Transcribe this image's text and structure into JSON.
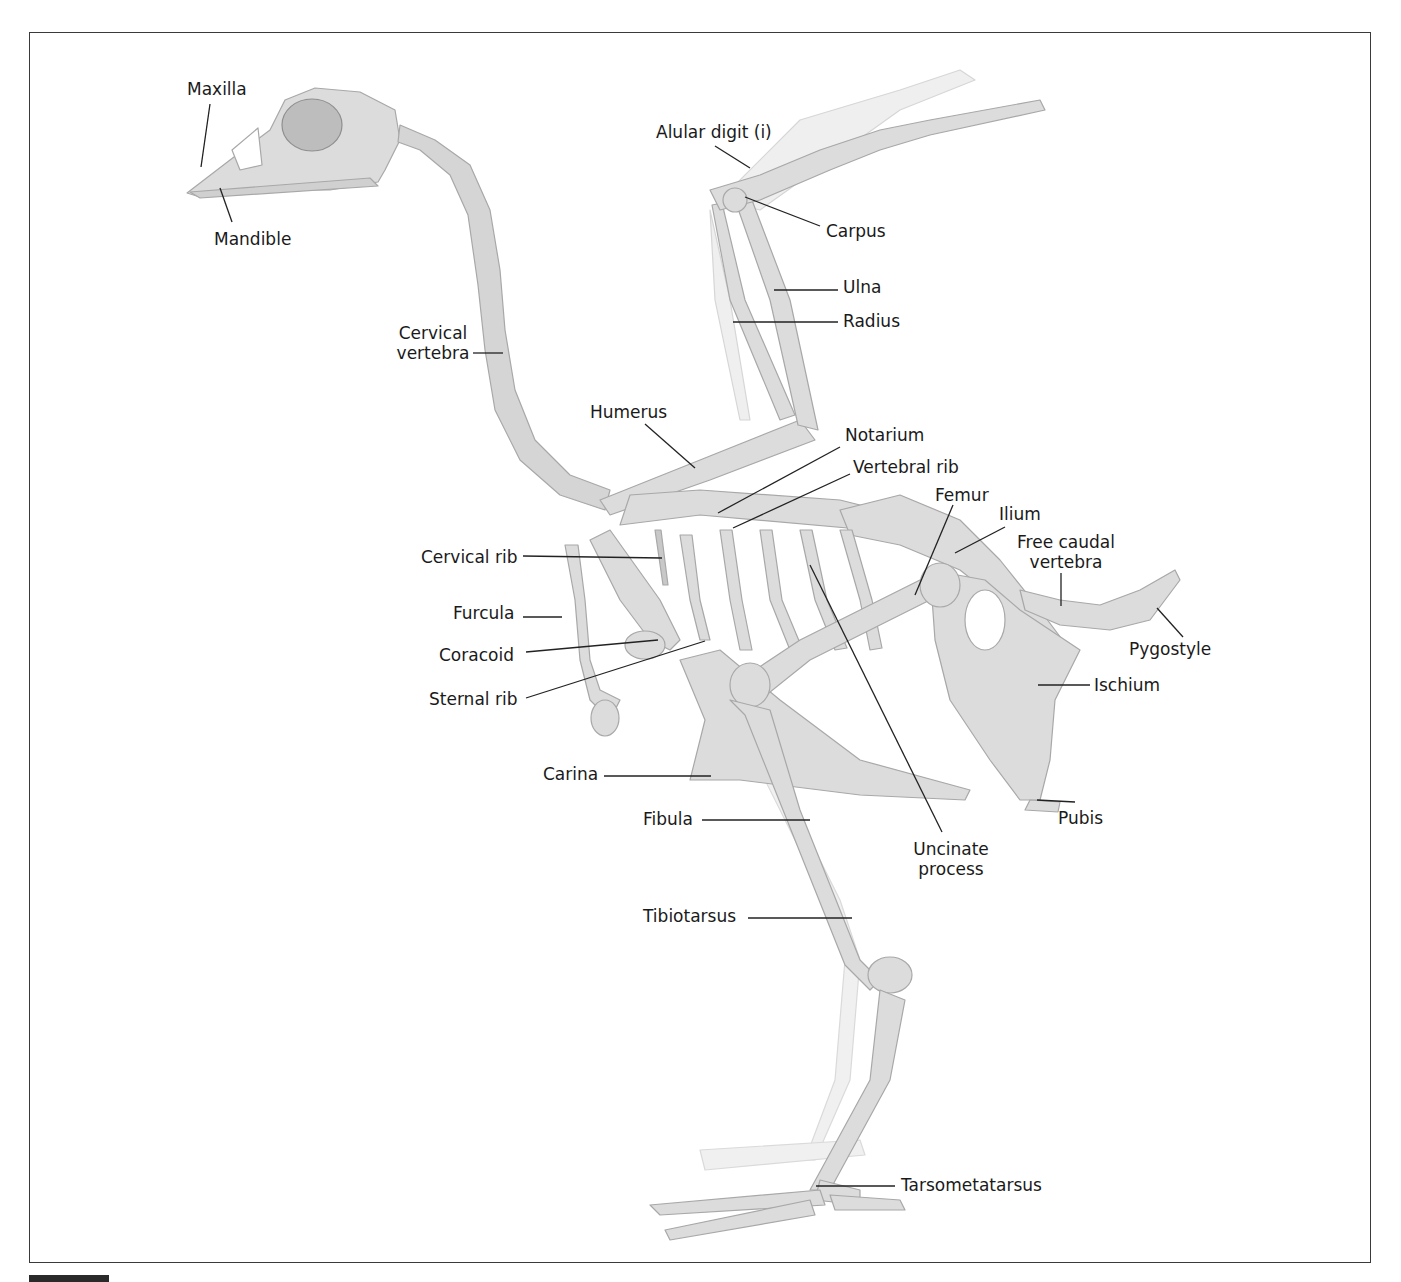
{
  "figure": {
    "colors": {
      "bone": "#d9d9d9",
      "bone_outline": "#a8a8a8",
      "bone_dark": "#b9b9b9",
      "ghost": "#ededed",
      "leader": "#222222",
      "frame": "#3a3a3a"
    }
  },
  "labels": {
    "maxilla": "Maxilla",
    "mandible": "Mandible",
    "alular_digit": "Alular digit (i)",
    "carpus": "Carpus",
    "ulna": "Ulna",
    "radius": "Radius",
    "cervical_vertebra_1": "Cervical",
    "cervical_vertebra_2": "vertebra",
    "humerus": "Humerus",
    "notarium": "Notarium",
    "vertebral_rib": "Vertebral rib",
    "femur": "Femur",
    "ilium": "Ilium",
    "free_caudal_1": "Free caudal",
    "free_caudal_2": "vertebra",
    "pygostyle": "Pygostyle",
    "cervical_rib": "Cervical rib",
    "furcula": "Furcula",
    "coracoid": "Coracoid",
    "sternal_rib": "Sternal rib",
    "ischium": "Ischium",
    "carina": "Carina",
    "pubis": "Pubis",
    "fibula": "Fibula",
    "uncinate_1": "Uncinate",
    "uncinate_2": "process",
    "tibiotarsus": "Tibiotarsus",
    "tarsometatarsus": "Tarsometatarsus"
  }
}
